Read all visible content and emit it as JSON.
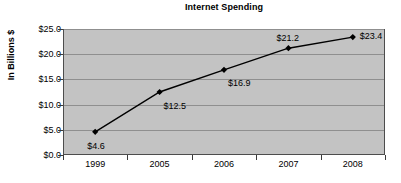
{
  "chart_data": {
    "type": "line",
    "title": "Internet Spending",
    "xlabel": "",
    "ylabel": "In Billions $",
    "categories": [
      "1999",
      "2005",
      "2006",
      "2007",
      "2008"
    ],
    "values": [
      4.6,
      12.5,
      16.9,
      21.2,
      23.4
    ],
    "point_labels": [
      "$4.6",
      "$12.5",
      "$16.9",
      "$21.2",
      "$23.4"
    ],
    "ylim": [
      0,
      25
    ],
    "ytick_values": [
      0,
      5,
      10,
      15,
      20,
      25
    ],
    "ytick_labels": [
      "$0.0",
      "$5.0",
      "$10.0",
      "$15.0",
      "$20.0",
      "$25.0"
    ],
    "grid": true,
    "legend": false,
    "series_color": "#000000",
    "marker": "diamond",
    "plot_background": "#c3c3c3",
    "gridline_color": "#8f8f8f",
    "axis_color": "#3a3a3a",
    "page_background": "#ffffff"
  }
}
